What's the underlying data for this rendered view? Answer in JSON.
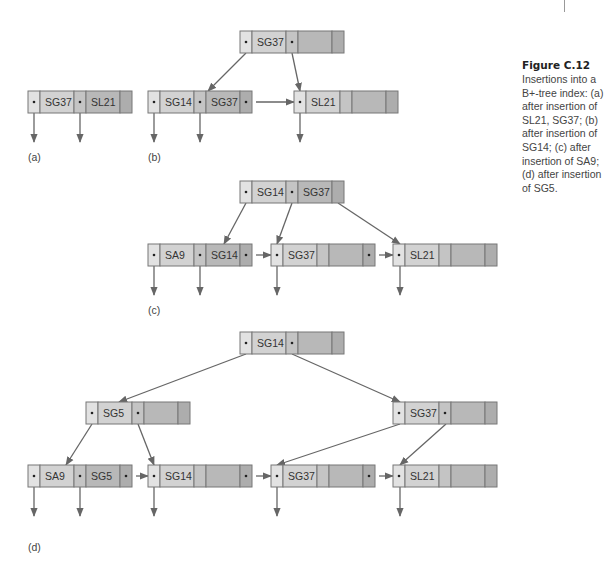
{
  "figure": {
    "title": "Figure C.12",
    "caption": "Insertions into a B+-tree index: (a) after insertion of SL21, SG37; (b) after insertion of SG14; (c) after insertion of SA9; (d) after insertion of SG5."
  },
  "colors": {
    "ptr_light": "#e2e2e2",
    "key_light": "#d2d2d2",
    "ptr_mid": "#c4c4c4",
    "key_dark": "#b8b8b8",
    "ptr_dark": "#adadad",
    "border": "#777777",
    "arrow": "#666666"
  },
  "panels": [
    {
      "label": "(a)",
      "label_pos": [
        28,
        161
      ],
      "nodes": [
        {
          "id": "a-leaf",
          "x": 28,
          "y": 91,
          "keys": [
            "SG37",
            "SL21"
          ]
        }
      ],
      "edges": [],
      "sibling_links": [],
      "down_pointers": [
        [
          34,
          113,
          142
        ],
        [
          80,
          113,
          142
        ]
      ]
    },
    {
      "label": "(b)",
      "label_pos": [
        148,
        161
      ],
      "nodes": [
        {
          "id": "b-root",
          "x": 240,
          "y": 31,
          "keys": [
            "SG37",
            ""
          ]
        },
        {
          "id": "b-leaf1",
          "x": 148,
          "y": 91,
          "keys": [
            "SG14",
            "SG37"
          ]
        },
        {
          "id": "b-leaf2",
          "x": 294,
          "y": 91,
          "keys": [
            "SL21",
            ""
          ]
        }
      ],
      "edges": [
        [
          246,
          53,
          208,
          91
        ],
        [
          292,
          53,
          300,
          91
        ]
      ],
      "sibling_links": [
        [
          254,
          102,
          294,
          102
        ]
      ],
      "down_pointers": [
        [
          154,
          113,
          142
        ],
        [
          200,
          113,
          142
        ],
        [
          300,
          113,
          142
        ]
      ]
    },
    {
      "label": "(c)",
      "label_pos": [
        148,
        314
      ],
      "nodes": [
        {
          "id": "c-root",
          "x": 240,
          "y": 181,
          "keys": [
            "SG14",
            "SG37"
          ]
        },
        {
          "id": "c-leaf1",
          "x": 148,
          "y": 244,
          "keys": [
            "SA9",
            "SG14"
          ]
        },
        {
          "id": "c-leaf2",
          "x": 271,
          "y": 244,
          "keys": [
            "SG37",
            ""
          ]
        },
        {
          "id": "c-leaf3",
          "x": 393,
          "y": 244,
          "keys": [
            "SL21",
            ""
          ]
        }
      ],
      "edges": [
        [
          246,
          203,
          224,
          244
        ],
        [
          292,
          203,
          277,
          244
        ],
        [
          338,
          203,
          400,
          244
        ]
      ],
      "sibling_links": [
        [
          254,
          255,
          271,
          255
        ],
        [
          377,
          255,
          393,
          255
        ]
      ],
      "down_pointers": [
        [
          154,
          266,
          295
        ],
        [
          200,
          266,
          295
        ],
        [
          277,
          266,
          295
        ],
        [
          400,
          266,
          295
        ]
      ]
    },
    {
      "label": "(d)",
      "label_pos": [
        28,
        551
      ],
      "nodes": [
        {
          "id": "d-root",
          "x": 240,
          "y": 332,
          "keys": [
            "SG14",
            ""
          ]
        },
        {
          "id": "d-int1",
          "x": 86,
          "y": 402,
          "keys": [
            "SG5",
            ""
          ]
        },
        {
          "id": "d-int2",
          "x": 393,
          "y": 402,
          "keys": [
            "SG37",
            ""
          ]
        },
        {
          "id": "d-leaf1",
          "x": 28,
          "y": 465,
          "keys": [
            "SA9",
            "SG5"
          ]
        },
        {
          "id": "d-leaf2",
          "x": 148,
          "y": 465,
          "keys": [
            "SG14",
            ""
          ]
        },
        {
          "id": "d-leaf3",
          "x": 271,
          "y": 465,
          "keys": [
            "SG37",
            ""
          ]
        },
        {
          "id": "d-leaf4",
          "x": 393,
          "y": 465,
          "keys": [
            "SL21",
            ""
          ]
        }
      ],
      "edges": [
        [
          246,
          354,
          119,
          402
        ],
        [
          292,
          354,
          400,
          402
        ],
        [
          92,
          424,
          66,
          465
        ],
        [
          138,
          424,
          154,
          465
        ],
        [
          400,
          424,
          277,
          465
        ],
        [
          446,
          424,
          400,
          465
        ]
      ],
      "sibling_links": [
        [
          134,
          476,
          148,
          476
        ],
        [
          254,
          476,
          271,
          476
        ],
        [
          377,
          476,
          393,
          476
        ]
      ],
      "down_pointers": [
        [
          34,
          487,
          516
        ],
        [
          80,
          487,
          516
        ],
        [
          154,
          487,
          516
        ],
        [
          277,
          487,
          516
        ],
        [
          400,
          487,
          516
        ]
      ]
    }
  ]
}
